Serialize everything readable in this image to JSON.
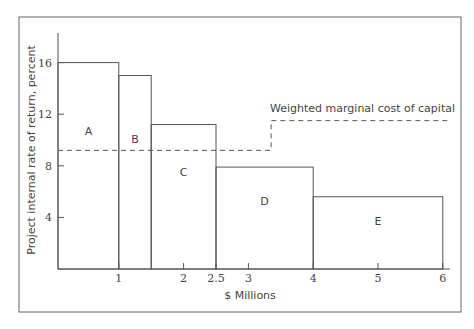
{
  "chart_data": {
    "type": "bar",
    "subtype": "investment-opportunity-schedule (variable-width step bars)",
    "title": "",
    "xlabel": "$ Millions",
    "ylabel": "Project internal rate of return, percent",
    "x_ticks": [
      "1",
      "2",
      "2.5",
      "3",
      "4",
      "5",
      "6"
    ],
    "y_ticks": [
      "4",
      "8",
      "12",
      "16"
    ],
    "xlim": [
      0,
      6.1
    ],
    "ylim": [
      0,
      18
    ],
    "grid": false,
    "projects": [
      {
        "label": "A",
        "x_start": 0,
        "x_end": 1,
        "irr": 16
      },
      {
        "label": "B",
        "x_start": 1,
        "x_end": 1.5,
        "irr": 15
      },
      {
        "label": "C",
        "x_start": 1.5,
        "x_end": 2.5,
        "irr": 11.2
      },
      {
        "label": "D",
        "x_start": 2.5,
        "x_end": 4,
        "irr": 7.9
      },
      {
        "label": "E",
        "x_start": 4,
        "x_end": 6,
        "irr": 5.6
      }
    ],
    "series": [
      {
        "name": "Weighted marginal cost of capital",
        "style": "dashed",
        "points": [
          [
            0,
            9.2
          ],
          [
            3.35,
            9.2
          ],
          [
            3.35,
            11.5
          ],
          [
            6.1,
            11.5
          ]
        ]
      }
    ],
    "annotations": [
      "Weighted marginal cost of capital"
    ]
  }
}
